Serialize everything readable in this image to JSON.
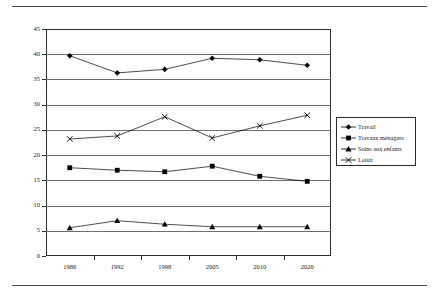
{
  "chart_data": {
    "type": "line",
    "title": "",
    "xlabel": "",
    "ylabel": "",
    "categories": [
      "1986",
      "1992",
      "1998",
      "2005",
      "2010",
      "2020"
    ],
    "ylim": [
      0,
      45
    ],
    "ytick_step": 5,
    "yticks": [
      "0",
      "5",
      "10",
      "15",
      "20",
      "25",
      "30",
      "35",
      "40",
      "45"
    ],
    "grid": "horizontal",
    "legend_position": "right",
    "series": [
      {
        "name": "Travail",
        "marker": "diamond",
        "color": "#000000",
        "values": [
          39.7,
          36.3,
          37.0,
          39.2,
          38.9,
          37.8
        ]
      },
      {
        "name": "Travaux ménagers",
        "marker": "square",
        "color": "#000000",
        "values": [
          17.5,
          17.0,
          16.7,
          17.8,
          15.8,
          14.8
        ]
      },
      {
        "name": "Soins aux enfants",
        "marker": "triangle",
        "color": "#000000",
        "values": [
          5.6,
          7.0,
          6.3,
          5.8,
          5.8,
          5.8
        ]
      },
      {
        "name": "Loisir",
        "marker": "cross",
        "color": "#000000",
        "values": [
          23.2,
          23.8,
          27.6,
          23.4,
          25.8,
          27.9
        ]
      }
    ]
  },
  "legend": {
    "items": [
      {
        "label": "Travail",
        "marker": "diamond"
      },
      {
        "label": "Travaux ménagers",
        "marker": "square"
      },
      {
        "label": "Soins aux enfants",
        "marker": "triangle"
      },
      {
        "label": "Loisir",
        "marker": "cross"
      }
    ]
  }
}
